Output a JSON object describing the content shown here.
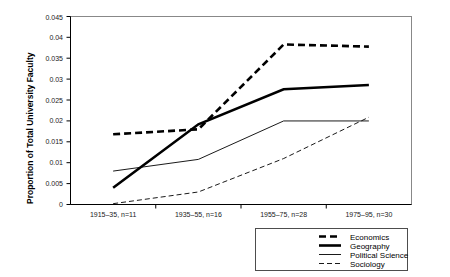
{
  "chart_data": {
    "type": "line",
    "title": "",
    "subtitle": "",
    "xlabel": "",
    "ylabel": "Proportion of Total University Faculty",
    "categories": [
      "1915–35, n=11",
      "1935–55, n=16",
      "1955–75, n=28",
      "1975–95, n=30"
    ],
    "ylim": [
      0,
      0.045
    ],
    "yticks": [
      "0",
      "0.005",
      "0.01",
      "0.015",
      "0.02",
      "0.025",
      "0.03",
      "0.035",
      "0.04",
      "0.045"
    ],
    "ytick_values": [
      0,
      0.005,
      0.01,
      0.015,
      0.02,
      0.025,
      0.03,
      0.035,
      0.04,
      0.045
    ],
    "grid": false,
    "legend_position": "bottom-right",
    "series": [
      {
        "name": "Economics",
        "values": [
          0.0168,
          0.018,
          0.0383,
          0.0378
        ],
        "style": "thick-dashed",
        "color": "#000000",
        "stroke_width": 2.6,
        "dash": "7,4"
      },
      {
        "name": "Geography",
        "values": [
          0.004,
          0.0192,
          0.0276,
          0.0286
        ],
        "style": "thick-solid",
        "color": "#000000",
        "stroke_width": 2.6,
        "dash": "none"
      },
      {
        "name": "Political Science",
        "values": [
          0.008,
          0.0108,
          0.02,
          0.02
        ],
        "style": "thin-solid",
        "color": "#000000",
        "stroke_width": 0.9,
        "dash": "none"
      },
      {
        "name": "Sociology",
        "values": [
          0.0002,
          0.003,
          0.011,
          0.0209
        ],
        "style": "thin-dashed",
        "color": "#000000",
        "stroke_width": 0.9,
        "dash": "5,3"
      }
    ]
  },
  "legend": {
    "items": [
      {
        "label": "Economics"
      },
      {
        "label": "Geography"
      },
      {
        "label": "Political Science"
      },
      {
        "label": "Sociology"
      }
    ]
  }
}
